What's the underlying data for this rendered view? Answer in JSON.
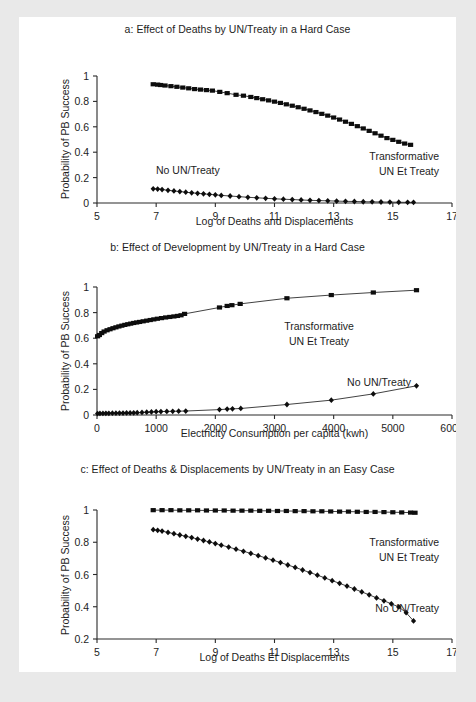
{
  "figure": {
    "background_color": "#e9e9e9",
    "page_color": "#ffffff",
    "ink_color": "#1d1d1d"
  },
  "panels": {
    "a": {
      "title": "a: Effect of Deaths by UN/Treaty in a Hard Case",
      "xlabel": "Log of Deaths and Displacements",
      "ylabel": "Probability of PB Success",
      "xticks": [
        "5",
        "7",
        "9",
        "11",
        "13",
        "15",
        "17"
      ],
      "yticks": [
        "0",
        "0.2",
        "0.4",
        "0.6",
        "0.8",
        "1"
      ],
      "annot_high": "Transformative",
      "annot_high2": "UN Et Treaty",
      "annot_low": "No UN/Treaty"
    },
    "b": {
      "title": "b: Effect of Development by UN/Treaty in a Hard Case",
      "xlabel": "Electricity Consumption per capita (kwh)",
      "ylabel": "Probability of PB Success",
      "xticks": [
        "0",
        "1000",
        "2000",
        "3000",
        "4000",
        "5000",
        "6000"
      ],
      "yticks": [
        "0",
        "0.2",
        "0.4",
        "0.6",
        "0.8",
        "1"
      ],
      "annot_high": "Transformative",
      "annot_high2": "UN Et Treaty",
      "annot_low": "No UN/Treaty"
    },
    "c": {
      "title": "c: Effect of Deaths & Displacements by UN/Treaty in an Easy Case",
      "xlabel": "Log of Deaths Et Displacements",
      "ylabel": "Probability of PB Success",
      "xticks": [
        "5",
        "7",
        "9",
        "11",
        "13",
        "15",
        "17"
      ],
      "yticks": [
        "0.2",
        "0.4",
        "0.6",
        "0.8",
        "1"
      ],
      "annot_high": "Transformative",
      "annot_high2": "UN Et Treaty",
      "annot_low": "No UN/Treaty"
    }
  },
  "chart_data": [
    {
      "id": "a",
      "type": "scatter",
      "title": "a: Effect of Deaths by UN/Treaty in a Hard Case",
      "xlabel": "Log of Deaths and Displacements",
      "ylabel": "Probability of PB Success",
      "xlim": [
        5,
        17
      ],
      "ylim": [
        0,
        1
      ],
      "xticks": [
        5,
        7,
        9,
        11,
        13,
        15,
        17
      ],
      "yticks": [
        0,
        0.2,
        0.4,
        0.6,
        0.8,
        1
      ],
      "grid": false,
      "legend": "annotations-inline",
      "series": [
        {
          "name": "Transformative UN & Treaty",
          "marker": "square",
          "x": [
            6.9,
            7.05,
            7.15,
            7.3,
            7.5,
            7.7,
            7.9,
            8.1,
            8.3,
            8.5,
            8.7,
            8.9,
            9.15,
            9.4,
            9.7,
            9.95,
            10.2,
            10.4,
            10.6,
            10.8,
            11.0,
            11.2,
            11.4,
            11.6,
            11.8,
            12.0,
            12.2,
            12.4,
            12.6,
            12.8,
            13.0,
            13.2,
            13.4,
            13.6,
            13.8,
            14.0,
            14.2,
            14.4,
            14.6,
            14.8,
            15.0,
            15.2,
            15.4,
            15.6
          ],
          "y": [
            0.935,
            0.932,
            0.929,
            0.925,
            0.92,
            0.915,
            0.909,
            0.903,
            0.897,
            0.893,
            0.889,
            0.885,
            0.875,
            0.865,
            0.852,
            0.845,
            0.835,
            0.826,
            0.817,
            0.808,
            0.798,
            0.788,
            0.777,
            0.766,
            0.754,
            0.742,
            0.729,
            0.716,
            0.702,
            0.688,
            0.673,
            0.657,
            0.64,
            0.623,
            0.605,
            0.587,
            0.568,
            0.549,
            0.53,
            0.511,
            0.497,
            0.482,
            0.468,
            0.458
          ]
        },
        {
          "name": "No UN/Treaty",
          "marker": "diamond",
          "x": [
            6.9,
            7.05,
            7.2,
            7.4,
            7.6,
            7.8,
            8.0,
            8.2,
            8.4,
            8.6,
            8.8,
            9.0,
            9.2,
            9.5,
            9.8,
            10.1,
            10.4,
            10.7,
            11.0,
            11.3,
            11.6,
            11.9,
            12.2,
            12.5,
            12.8,
            13.1,
            13.4,
            13.7,
            14.0,
            14.3,
            14.6,
            14.9,
            15.2,
            15.5,
            15.7
          ],
          "y": [
            0.112,
            0.11,
            0.106,
            0.1,
            0.095,
            0.09,
            0.085,
            0.08,
            0.076,
            0.072,
            0.068,
            0.064,
            0.06,
            0.055,
            0.05,
            0.045,
            0.041,
            0.037,
            0.033,
            0.03,
            0.027,
            0.024,
            0.021,
            0.019,
            0.017,
            0.015,
            0.013,
            0.012,
            0.01,
            0.009,
            0.008,
            0.007,
            0.006,
            0.005,
            0.005
          ]
        }
      ]
    },
    {
      "id": "b",
      "type": "scatter",
      "title": "b: Effect of Development by UN/Treaty in a Hard Case",
      "xlabel": "Electricity Consumption per capita (kwh)",
      "ylabel": "Probability of PB Success",
      "xlim": [
        0,
        6000
      ],
      "ylim": [
        0,
        1
      ],
      "xticks": [
        0,
        1000,
        2000,
        3000,
        4000,
        5000,
        6000
      ],
      "yticks": [
        0,
        0.2,
        0.4,
        0.6,
        0.8,
        1
      ],
      "grid": false,
      "legend": "annotations-inline",
      "series": [
        {
          "name": "Transformative UN & Treaty",
          "marker": "square",
          "x": [
            10,
            40,
            80,
            120,
            170,
            220,
            270,
            320,
            370,
            420,
            470,
            520,
            570,
            620,
            670,
            720,
            780,
            840,
            900,
            960,
            1020,
            1090,
            1160,
            1230,
            1300,
            1360,
            1420,
            1480,
            2070,
            2200,
            2280,
            2420,
            3210,
            3960,
            4670,
            5400
          ],
          "y": [
            0.615,
            0.625,
            0.64,
            0.652,
            0.662,
            0.67,
            0.678,
            0.685,
            0.692,
            0.698,
            0.704,
            0.709,
            0.714,
            0.719,
            0.723,
            0.727,
            0.732,
            0.737,
            0.742,
            0.747,
            0.752,
            0.757,
            0.762,
            0.766,
            0.77,
            0.774,
            0.779,
            0.79,
            0.84,
            0.852,
            0.858,
            0.868,
            0.912,
            0.937,
            0.957,
            0.975
          ]
        },
        {
          "name": "No UN/Treaty",
          "marker": "diamond",
          "x": [
            10,
            50,
            100,
            150,
            200,
            260,
            320,
            380,
            440,
            500,
            560,
            620,
            680,
            760,
            840,
            920,
            1000,
            1080,
            1180,
            1280,
            1380,
            1500,
            2070,
            2200,
            2290,
            2430,
            3210,
            3960,
            4670,
            5400
          ],
          "y": [
            0.011,
            0.012,
            0.012,
            0.013,
            0.013,
            0.014,
            0.014,
            0.015,
            0.015,
            0.016,
            0.016,
            0.017,
            0.018,
            0.02,
            0.022,
            0.024,
            0.026,
            0.027,
            0.028,
            0.029,
            0.03,
            0.031,
            0.042,
            0.046,
            0.048,
            0.051,
            0.082,
            0.116,
            0.165,
            0.228
          ]
        }
      ]
    },
    {
      "id": "c",
      "type": "scatter",
      "title": "c: Effect of Deaths & Displacements by UN/Treaty in an Easy Case",
      "xlabel": "Log of Deaths & Displacements",
      "ylabel": "Probability of PB Success",
      "xlim": [
        5,
        17
      ],
      "ylim": [
        0.2,
        1
      ],
      "xticks": [
        5,
        7,
        9,
        11,
        13,
        15,
        17
      ],
      "yticks": [
        0.2,
        0.4,
        0.6,
        0.8,
        1
      ],
      "grid": false,
      "legend": "annotations-inline",
      "series": [
        {
          "name": "Transformative UN & Treaty",
          "marker": "square",
          "x": [
            6.9,
            7.2,
            7.5,
            7.8,
            8.1,
            8.4,
            8.7,
            9.0,
            9.3,
            9.6,
            9.9,
            10.2,
            10.5,
            10.8,
            11.1,
            11.4,
            11.7,
            12.0,
            12.3,
            12.6,
            12.9,
            13.2,
            13.5,
            13.8,
            14.1,
            14.4,
            14.7,
            15.0,
            15.3,
            15.6,
            15.75
          ],
          "y": [
            0.999,
            0.999,
            0.999,
            0.998,
            0.998,
            0.998,
            0.997,
            0.997,
            0.997,
            0.996,
            0.996,
            0.996,
            0.995,
            0.995,
            0.994,
            0.994,
            0.993,
            0.993,
            0.992,
            0.992,
            0.991,
            0.99,
            0.99,
            0.989,
            0.988,
            0.988,
            0.987,
            0.986,
            0.985,
            0.984,
            0.983
          ]
        },
        {
          "name": "No UN/Treaty",
          "marker": "diamond",
          "x": [
            6.9,
            7.05,
            7.2,
            7.4,
            7.6,
            7.8,
            8.0,
            8.2,
            8.4,
            8.6,
            8.8,
            9.0,
            9.2,
            9.45,
            9.7,
            9.95,
            10.2,
            10.45,
            10.7,
            10.95,
            11.2,
            11.45,
            11.7,
            11.95,
            12.2,
            12.45,
            12.7,
            12.95,
            13.2,
            13.45,
            13.7,
            13.95,
            14.2,
            14.45,
            14.7,
            14.95,
            15.2,
            15.45,
            15.7
          ],
          "y": [
            0.878,
            0.874,
            0.869,
            0.861,
            0.853,
            0.845,
            0.837,
            0.829,
            0.82,
            0.811,
            0.802,
            0.792,
            0.782,
            0.77,
            0.757,
            0.744,
            0.731,
            0.717,
            0.703,
            0.689,
            0.674,
            0.659,
            0.644,
            0.628,
            0.612,
            0.596,
            0.579,
            0.562,
            0.545,
            0.528,
            0.51,
            0.492,
            0.474,
            0.455,
            0.437,
            0.418,
            0.399,
            0.363,
            0.312
          ]
        }
      ]
    }
  ]
}
